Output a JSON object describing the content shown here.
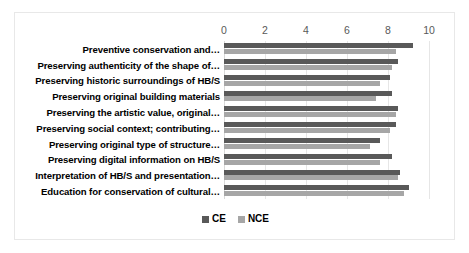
{
  "chart_data": {
    "type": "bar",
    "orientation": "horizontal",
    "title": "",
    "xlabel": "",
    "ylabel": "",
    "xlim": [
      0,
      10
    ],
    "xticks": [
      0,
      2,
      4,
      6,
      8,
      10
    ],
    "xtick_labels": [
      "0",
      "2",
      "4",
      "6",
      "8",
      "10"
    ],
    "grid": true,
    "legend_position": "bottom",
    "categories": [
      "Preventive conservation and…",
      "Preserving authenticity of the shape of…",
      "Preserving historic surroundings of HB/S",
      "Preserving original building materials",
      "Preserving the artistic value, original…",
      "Preserving social context; contributing…",
      "Preserving original type of structure…",
      "Preserving digital information on HB/S",
      "Interpretation of HB/S and presentation…",
      "Education for conservation of cultural…"
    ],
    "series": [
      {
        "name": "CE",
        "color": "#595959",
        "values": [
          9.2,
          8.5,
          8.1,
          8.2,
          8.5,
          8.4,
          7.6,
          8.2,
          8.6,
          9.0
        ]
      },
      {
        "name": "NCE",
        "color": "#a6a6a6",
        "values": [
          8.4,
          8.2,
          7.6,
          7.4,
          8.4,
          8.1,
          7.1,
          7.6,
          8.5,
          8.8
        ]
      }
    ]
  },
  "legend": {
    "items": [
      {
        "label": "CE"
      },
      {
        "label": "NCE"
      }
    ]
  }
}
